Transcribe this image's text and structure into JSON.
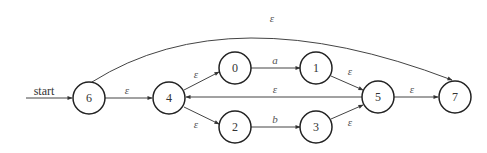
{
  "diagram": {
    "start_label": "start",
    "start_state": "6",
    "accept_state": "7",
    "nodes": [
      {
        "id": "6",
        "label": "6",
        "x": 89,
        "y": 98
      },
      {
        "id": "4",
        "label": "4",
        "x": 169,
        "y": 98
      },
      {
        "id": "0",
        "label": "0",
        "x": 235,
        "y": 68
      },
      {
        "id": "2",
        "label": "2",
        "x": 235,
        "y": 127
      },
      {
        "id": "1",
        "label": "1",
        "x": 316,
        "y": 68
      },
      {
        "id": "3",
        "label": "3",
        "x": 316,
        "y": 127
      },
      {
        "id": "5",
        "label": "5",
        "x": 378,
        "y": 97
      },
      {
        "id": "7",
        "label": "7",
        "x": 455,
        "y": 97
      }
    ],
    "edges": [
      {
        "from": "6",
        "to": "4",
        "label": "ε"
      },
      {
        "from": "4",
        "to": "0",
        "label": "ε"
      },
      {
        "from": "4",
        "to": "2",
        "label": "ε"
      },
      {
        "from": "0",
        "to": "1",
        "label": "a"
      },
      {
        "from": "2",
        "to": "3",
        "label": "b"
      },
      {
        "from": "1",
        "to": "5",
        "label": "ε"
      },
      {
        "from": "3",
        "to": "5",
        "label": "ε"
      },
      {
        "from": "5",
        "to": "4",
        "label": "ε"
      },
      {
        "from": "5",
        "to": "7",
        "label": "ε"
      },
      {
        "from": "6",
        "to": "7",
        "label": "ε"
      }
    ]
  }
}
